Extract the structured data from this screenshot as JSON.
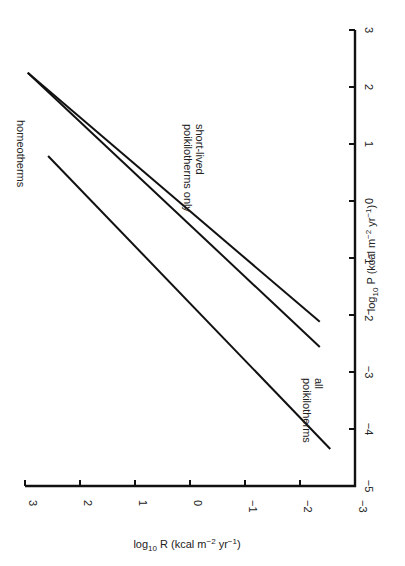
{
  "chart_data": {
    "type": "line",
    "title": "",
    "orientation": "rotated 90° clockwise (page turned sideways)",
    "xlabel": "log10 R (kcal m-2 yr-1)",
    "ylabel": "log10 P (kcal m-2 yr-1)",
    "xlabel_parts": {
      "pre": "log",
      "sub": "10",
      "mid": " R (kcal m",
      "sup1": "−2",
      "mid2": " yr",
      "sup2": "−1",
      "post": ")"
    },
    "ylabel_parts": {
      "pre": "log",
      "sub": "10",
      "mid": " P (kcal m",
      "sup1": "−2",
      "mid2": " yr",
      "sup2": "−1",
      "post": ")"
    },
    "xlim": [
      -3,
      3
    ],
    "ylim": [
      -5,
      3
    ],
    "x_ticks": [
      "3",
      "2",
      "1",
      "0",
      "−1",
      "−2",
      "−3"
    ],
    "x_tick_values": [
      3,
      2,
      1,
      0,
      -1,
      -2,
      -3
    ],
    "y_ticks": [
      "3",
      "2",
      "1",
      "0",
      "−1",
      "−2",
      "−3",
      "−4",
      "−5"
    ],
    "y_tick_values": [
      3,
      2,
      1,
      0,
      -1,
      -2,
      -3,
      -4,
      -5
    ],
    "grid": false,
    "series": [
      {
        "name": "short-lived poikilotherms only",
        "label_lines": [
          "short-lived",
          "poikilotherms only"
        ],
        "x": [
          2.95,
          -2.36
        ],
        "y": [
          2.25,
          -2.12
        ]
      },
      {
        "name": "all poikilotherms",
        "label_lines": [
          "all",
          "poikilotherms"
        ],
        "x": [
          2.95,
          -2.36
        ],
        "y": [
          2.25,
          -2.56
        ]
      },
      {
        "name": "homeotherms",
        "label_lines": [
          "homeotherms"
        ],
        "x": [
          2.58,
          -2.55
        ],
        "y": [
          0.79,
          -4.35
        ]
      }
    ]
  }
}
